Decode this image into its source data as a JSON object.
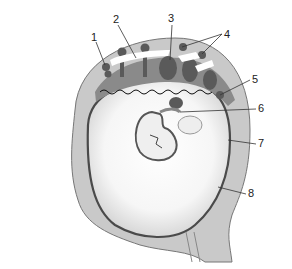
{
  "diagram": {
    "labels": [
      {
        "num": "1",
        "x": 91,
        "y": 32
      },
      {
        "num": "2",
        "x": 113,
        "y": 14
      },
      {
        "num": "3",
        "x": 168,
        "y": 13
      },
      {
        "num": "4",
        "x": 224,
        "y": 29
      },
      {
        "num": "5",
        "x": 252,
        "y": 74
      },
      {
        "num": "6",
        "x": 258,
        "y": 103
      },
      {
        "num": "7",
        "x": 258,
        "y": 138
      },
      {
        "num": "8",
        "x": 248,
        "y": 188
      }
    ],
    "colors": {
      "uterine_wall": "#c9c9c9",
      "outline": "#555555",
      "villi": "#5a5a5a",
      "cavity": "#f4f4f4",
      "background": "#ffffff"
    }
  }
}
